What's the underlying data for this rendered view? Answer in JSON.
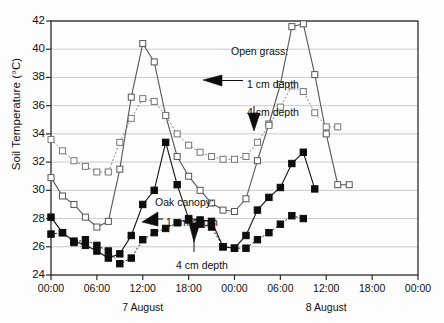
{
  "chart_data": {
    "type": "line",
    "title": "",
    "subtitle": "",
    "xlabel": "",
    "ylabel": "Soil Temperature (°C)",
    "ylim": [
      24,
      42
    ],
    "yticks": [
      24,
      26,
      28,
      30,
      32,
      34,
      36,
      38,
      40,
      42
    ],
    "xlim_hours": [
      0,
      48
    ],
    "xticks_hours": [
      0,
      6,
      12,
      18,
      24,
      30,
      36,
      42,
      48
    ],
    "xticklabels": [
      "00:00",
      "06:00",
      "12:00",
      "18:00",
      "00:00",
      "06:00",
      "12:00",
      "18:00",
      "00:00"
    ],
    "day_labels": [
      {
        "text": "7 August",
        "hour": 12
      },
      {
        "text": "8 August",
        "hour": 36
      }
    ],
    "grid": "horizontal",
    "legend": "annotations",
    "x_hours": [
      0,
      1.5,
      3,
      4.5,
      6,
      7.5,
      9,
      10.5,
      12,
      13.5,
      15,
      16.5,
      18,
      19.5,
      21,
      22.5,
      24,
      25.5,
      27,
      28.5,
      30,
      31.5,
      33,
      34.5,
      36,
      37.5,
      39,
      40.5,
      42,
      43.5,
      45
    ],
    "series": [
      {
        "name": "Open grass: 1 cm depth",
        "marker": "open-square",
        "linestyle": "solid",
        "color": "#555555",
        "values": [
          30.9,
          29.6,
          29.0,
          28.1,
          27.4,
          27.8,
          31.5,
          36.6,
          40.4,
          39.1,
          35.3,
          32.4,
          31.0,
          30.0,
          29.1,
          28.6,
          28.5,
          29.4,
          32.1,
          34.7,
          37.5,
          41.6,
          41.8,
          38.2,
          34.0,
          30.4,
          30.4
        ]
      },
      {
        "name": "Open grass: 4 cm depth",
        "marker": "open-square",
        "linestyle": "dotted",
        "color": "#777777",
        "values": [
          33.6,
          32.8,
          32.1,
          31.7,
          31.3,
          31.3,
          33.4,
          35.1,
          36.5,
          36.3,
          35.3,
          34.0,
          33.2,
          32.7,
          32.4,
          32.2,
          32.2,
          32.4,
          33.4,
          34.6,
          35.9,
          37.4,
          37.0,
          35.5,
          34.5,
          34.5
        ]
      },
      {
        "name": "Oak canopy: 1 cm depth",
        "marker": "filled-square",
        "linestyle": "solid",
        "color": "#111111",
        "values": [
          28.1,
          27.0,
          26.4,
          26.1,
          25.7,
          25.2,
          25.5,
          26.8,
          29.0,
          30.0,
          33.4,
          30.4,
          28.0,
          27.9,
          27.8,
          26.0,
          25.9,
          26.8,
          28.6,
          29.5,
          30.2,
          31.9,
          32.7,
          30.1
        ]
      },
      {
        "name": "Oak canopy: 4 cm depth",
        "marker": "filled-square",
        "linestyle": "dotted",
        "color": "#111111",
        "values": [
          26.9,
          27.0,
          26.3,
          26.5,
          26.1,
          25.7,
          24.8,
          25.2,
          26.5,
          27.0,
          27.3,
          27.7,
          27.9,
          27.6,
          27.4,
          26.0,
          25.9,
          25.9,
          26.5,
          27.0,
          27.6,
          28.2,
          28.0
        ]
      }
    ],
    "annotations": [
      {
        "name": "open-grass-group-label",
        "text": "Open grass:",
        "x": 231,
        "y": 45
      },
      {
        "name": "open-grass-1cm-label",
        "text": "1 cm depth",
        "x": 247,
        "y": 78
      },
      {
        "name": "open-grass-4cm-label",
        "text": "4 cm depth",
        "x": 247,
        "y": 106
      },
      {
        "name": "oak-canopy-group-label",
        "text": "Oak canopy:",
        "x": 155,
        "y": 196
      },
      {
        "name": "oak-canopy-1cm-label",
        "text": "1 cm depth",
        "x": 166,
        "y": 216
      },
      {
        "name": "oak-canopy-4cm-label",
        "text": "4 cm depth",
        "x": 176,
        "y": 259
      }
    ]
  }
}
